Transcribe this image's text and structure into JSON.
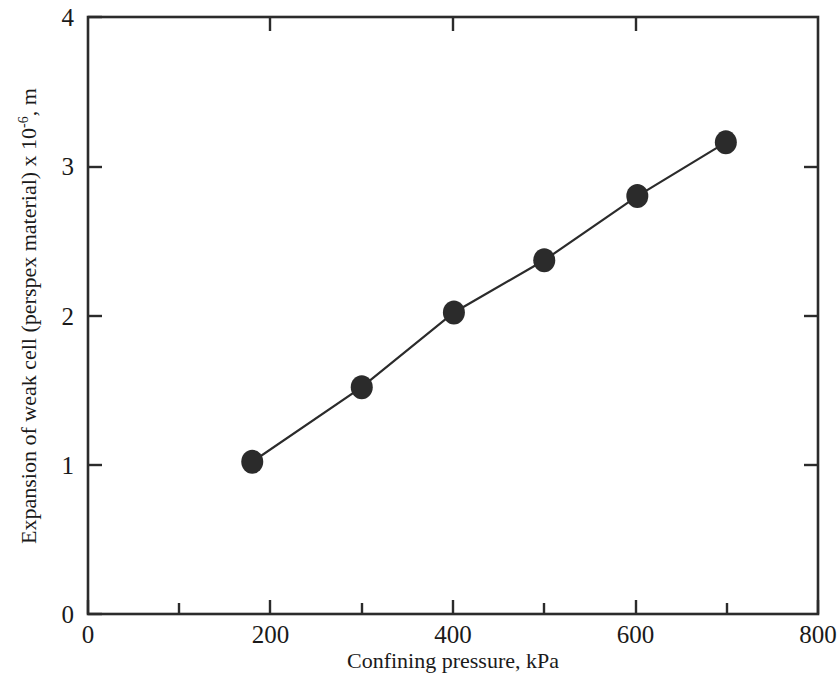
{
  "chart_data": {
    "type": "line",
    "title": "",
    "subtitle": "",
    "xlabel": "Confining pressure, kPa",
    "ylabel_main": "Expansion of weak cell (perspex material) x 10",
    "ylabel_exponent": "-6",
    "ylabel_tail": ", m",
    "ylabel_full": "Expansion of weak cell (perspex material) x 10-6 , m",
    "xlim": [
      0,
      800
    ],
    "ylim": [
      0,
      4
    ],
    "grid": false,
    "legend": "none",
    "x_major_ticks": [
      0,
      200,
      400,
      600,
      800
    ],
    "x_minor_ticks": [
      100,
      300,
      500,
      700
    ],
    "y_major_ticks": [
      0,
      1,
      2,
      3,
      4
    ],
    "x_tick_labels": [
      "0",
      "200",
      "400",
      "600",
      "800"
    ],
    "y_tick_labels": [
      "0",
      "1",
      "2",
      "3",
      "4"
    ],
    "marker": "filled-circle",
    "marker_color": "#2b2b2b",
    "line_color": "#2b2b2b",
    "series": [
      {
        "name": "Expansion of weak cell",
        "x": [
          180,
          300,
          401,
          500,
          602,
          699
        ],
        "values": [
          1.02,
          1.52,
          2.02,
          2.37,
          2.8,
          3.16
        ]
      }
    ]
  },
  "axes_geometry": {
    "left_px": 88,
    "right_px": 818,
    "top_px": 17,
    "bottom_px": 614
  }
}
